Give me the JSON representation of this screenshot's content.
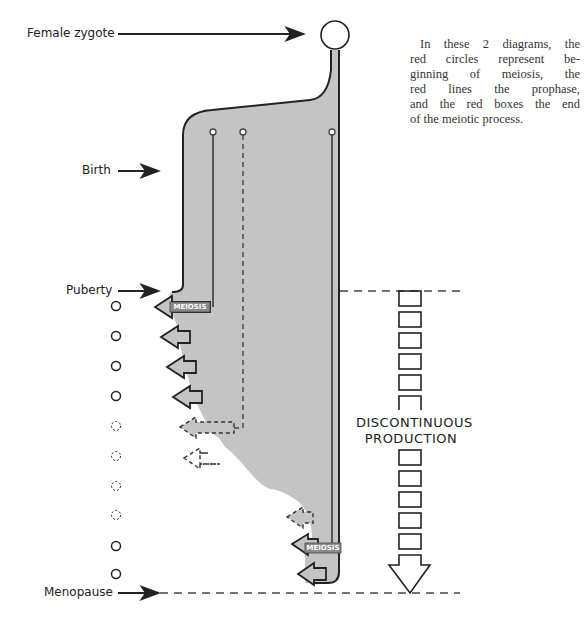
{
  "labels": {
    "female_zygote": "Female zygote",
    "birth": "Birth",
    "puberty": "Puberty",
    "menopause": "Menopause"
  },
  "note": {
    "lines": [
      "In these 2 diagrams, the",
      "red circles represent be-",
      "ginning of meiosis, the",
      "red lines the prophase,",
      "and the red boxes the end",
      "of the meiotic process."
    ]
  },
  "meiosis_labels": [
    "MEIOSIS",
    "MEIOSIS"
  ],
  "discontinuous_production": {
    "line1": "DISCONTINUOUS",
    "line2": "PRODUCTION",
    "boxes_above": 6,
    "boxes_below": 5
  },
  "ovulation_circles": {
    "count": 10,
    "styles": [
      "solid",
      "solid",
      "solid",
      "solid",
      "dashed",
      "dashed",
      "dashed",
      "dashed",
      "solid",
      "solid"
    ]
  },
  "colors": {
    "fill": "#c4c4c4",
    "stroke": "#222222",
    "dash": "#444444"
  }
}
